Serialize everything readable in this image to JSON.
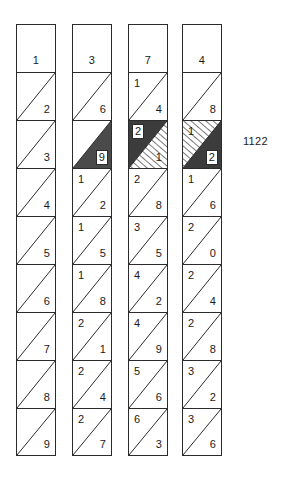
{
  "figure": {
    "side_label": "1122",
    "side_label_x": 243,
    "side_label_y": 135,
    "geometry": {
      "column_width": 40,
      "cell_height": 48,
      "column_top": 24,
      "column_x": [
        16,
        72,
        128,
        182
      ]
    },
    "colors": {
      "stroke": "#2b2b2b",
      "background": "#ffffff",
      "dark_fill": "#4a4a4a",
      "dark_fill_alt": "#3c3c3c",
      "hatch_line": "#3a3a3a",
      "text": "#1a1a1a"
    },
    "legend": {
      "plain_cell": "cell split by a diagonal from bottom-left to top-right",
      "dark_region": "solid shaded triangle",
      "hatched_region": "diagonally hatched triangle",
      "boxed_digit": "digit drawn inside a small white box"
    }
  },
  "columns": [
    {
      "name": "column-1",
      "cells": [
        {
          "style": "plain-no-diagonal",
          "center": "1"
        },
        {
          "style": "diagonal",
          "upper": "",
          "lower": "2"
        },
        {
          "style": "diagonal",
          "upper": "",
          "lower": "3"
        },
        {
          "style": "diagonal",
          "upper": "",
          "lower": "4"
        },
        {
          "style": "diagonal",
          "upper": "",
          "lower": "5"
        },
        {
          "style": "diagonal",
          "upper": "",
          "lower": "6"
        },
        {
          "style": "diagonal",
          "upper": "",
          "lower": "7"
        },
        {
          "style": "diagonal",
          "upper": "",
          "lower": "8"
        },
        {
          "style": "diagonal",
          "upper": "",
          "lower": "9"
        }
      ]
    },
    {
      "name": "column-2",
      "cells": [
        {
          "style": "plain-no-diagonal",
          "center": "3"
        },
        {
          "style": "diagonal",
          "upper": "",
          "lower": "6"
        },
        {
          "style": "upper-dark",
          "upper": "",
          "lower": "9",
          "lower_boxed": true
        },
        {
          "style": "diagonal",
          "upper": "1",
          "lower": "2"
        },
        {
          "style": "diagonal",
          "upper": "1",
          "lower": "5"
        },
        {
          "style": "diagonal",
          "upper": "1",
          "lower": "8"
        },
        {
          "style": "diagonal",
          "upper": "2",
          "lower": "1"
        },
        {
          "style": "diagonal",
          "upper": "2",
          "lower": "4"
        },
        {
          "style": "diagonal",
          "upper": "2",
          "lower": "7"
        }
      ]
    },
    {
      "name": "column-3",
      "cells": [
        {
          "style": "plain-no-diagonal",
          "center": "7"
        },
        {
          "style": "diagonal",
          "upper": "1",
          "lower": "4"
        },
        {
          "style": "lower-dark-upper-hatched",
          "upper": "2",
          "upper_boxed": true,
          "lower": "1"
        },
        {
          "style": "diagonal",
          "upper": "2",
          "lower": "8"
        },
        {
          "style": "diagonal",
          "upper": "3",
          "lower": "5"
        },
        {
          "style": "diagonal",
          "upper": "4",
          "lower": "2"
        },
        {
          "style": "diagonal",
          "upper": "4",
          "lower": "9"
        },
        {
          "style": "diagonal",
          "upper": "5",
          "lower": "6"
        },
        {
          "style": "diagonal",
          "upper": "6",
          "lower": "3"
        }
      ]
    },
    {
      "name": "column-4",
      "cells": [
        {
          "style": "plain-no-diagonal",
          "center": "4"
        },
        {
          "style": "diagonal",
          "upper": "",
          "lower": "8"
        },
        {
          "style": "upper-hatched-lower-dark",
          "upper": "1",
          "lower": "2",
          "lower_boxed": true
        },
        {
          "style": "diagonal",
          "upper": "1",
          "lower": "6"
        },
        {
          "style": "diagonal",
          "upper": "2",
          "lower": "0"
        },
        {
          "style": "diagonal",
          "upper": "2",
          "lower": "4"
        },
        {
          "style": "diagonal",
          "upper": "2",
          "lower": "8"
        },
        {
          "style": "diagonal",
          "upper": "3",
          "lower": "2"
        },
        {
          "style": "diagonal",
          "upper": "3",
          "lower": "6"
        }
      ]
    }
  ]
}
